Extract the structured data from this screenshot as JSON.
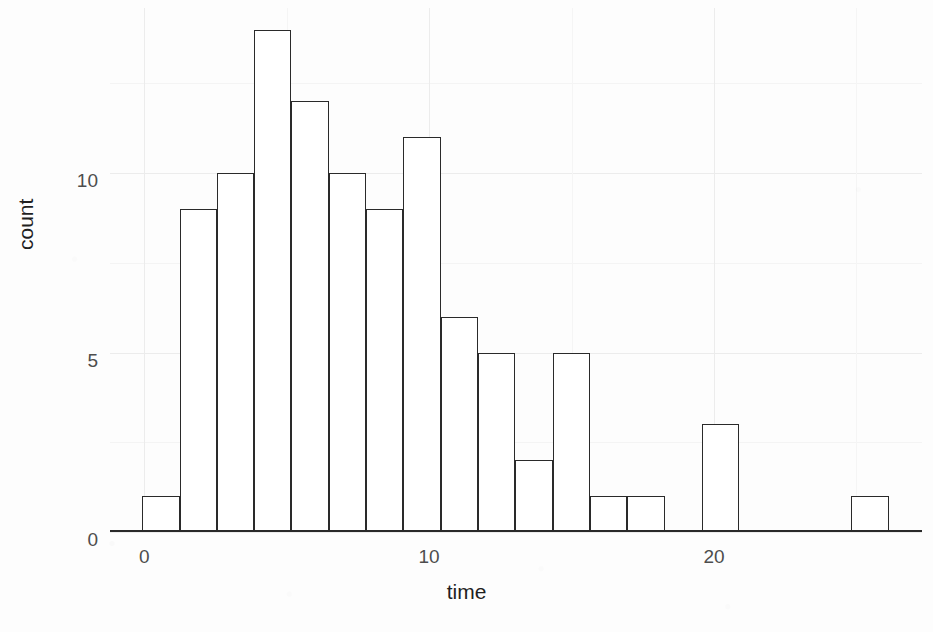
{
  "chart_data": {
    "type": "bar",
    "title": "",
    "subtitle": "",
    "xlabel": "time",
    "ylabel": "count",
    "xlim": [
      -1.2,
      27.3
    ],
    "ylim": [
      0,
      14.6
    ],
    "xticks": [
      0,
      10,
      20
    ],
    "xtick_labels": [
      "0",
      "10",
      "20"
    ],
    "yticks": [
      0,
      5,
      10
    ],
    "ytick_labels": [
      "0",
      "5",
      "10"
    ],
    "grid": true,
    "grid_minor_y": [
      2.5,
      7.5,
      12.5
    ],
    "grid_minor_x": [
      5,
      15,
      25
    ],
    "legend": "none",
    "bin_width": 1.31,
    "bin_starts": [
      -0.07,
      1.24,
      2.55,
      3.86,
      5.17,
      6.48,
      7.79,
      9.1,
      10.41,
      11.72,
      13.03,
      14.34,
      15.65,
      16.96,
      18.27,
      19.58,
      20.89,
      22.2,
      23.51,
      24.82
    ],
    "categories": [
      "-0.1",
      "1.2",
      "2.6",
      "3.9",
      "5.2",
      "6.5",
      "7.8",
      "9.1",
      "10.4",
      "11.7",
      "13.0",
      "14.3",
      "15.7",
      "17.0",
      "18.3",
      "19.6",
      "20.9",
      "22.2",
      "23.5",
      "24.8"
    ],
    "values": [
      1,
      9,
      10,
      14,
      12,
      10,
      9,
      11,
      6,
      5,
      2,
      5,
      1,
      1,
      0,
      3,
      0,
      0,
      0,
      1
    ],
    "bar_fill": "#ffffff",
    "bar_stroke": "#2a2a2a",
    "panel_background": "#fdfdfd",
    "gridline_color": "#ececec",
    "tick_label_color": "#4d4d4d",
    "axis_title_color": "#1f1f1f"
  },
  "axes": {
    "x_title": "time",
    "y_title": "count"
  }
}
